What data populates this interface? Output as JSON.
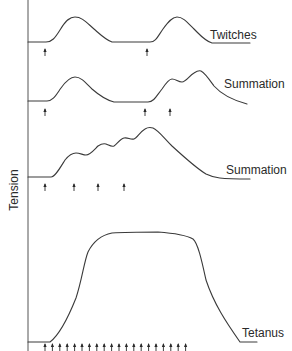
{
  "diagram": {
    "axis_label": "Tension",
    "colors": {
      "line": "#3a3a3a",
      "text": "#2a2a2a",
      "background": "#ffffff"
    },
    "traces": [
      {
        "id": "twitches",
        "label": "Twitches",
        "stimuli_x": [
          45,
          147
        ]
      },
      {
        "id": "summation-1",
        "label": "Summation",
        "stimuli_x": [
          45,
          145,
          170
        ]
      },
      {
        "id": "summation-2",
        "label": "Summation",
        "stimuli_x": [
          45,
          74,
          98,
          124
        ]
      },
      {
        "id": "tetanus",
        "label": "Tetanus",
        "stimuli_x": [
          45,
          52.4,
          59.8,
          67.2,
          74.6,
          82,
          89.4,
          96.8,
          104.2,
          111.6,
          119,
          126.4,
          133.8,
          141.2,
          148.6,
          156,
          163.4,
          170.8,
          178.2,
          185.6
        ]
      }
    ]
  }
}
